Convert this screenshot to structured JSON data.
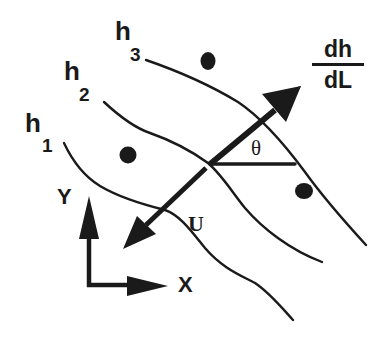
{
  "diagram": {
    "type": "hydraulic gradient / equipotential contour diagram",
    "colors": {
      "ink": "#1a1a1a",
      "background": "#ffffff"
    },
    "contours": [
      {
        "label_main": "h",
        "label_sub": "1"
      },
      {
        "label_main": "h",
        "label_sub": "2"
      },
      {
        "label_main": "h",
        "label_sub": "3"
      }
    ],
    "gradient_label": {
      "numerator": "dh",
      "denominator": "dL"
    },
    "angle_label": "θ",
    "velocity_label": "U",
    "axes": {
      "y_label": "Y",
      "x_label": "X"
    },
    "points_count": 3
  }
}
